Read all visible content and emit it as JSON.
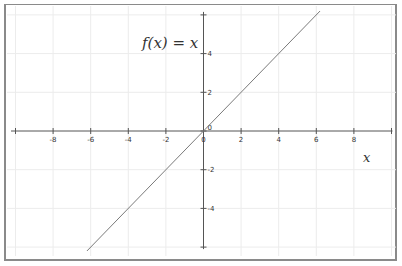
{
  "chart_data": {
    "type": "line",
    "title": "f(x) = x",
    "xlabel": "x",
    "ylabel": "",
    "function": "f(x) = x",
    "series": [
      {
        "name": "f(x) = x",
        "x": [
          -6.2,
          6.2
        ],
        "y": [
          -6.2,
          6.2
        ],
        "color": "#7a7a7a"
      }
    ],
    "xlim": [
      -10.5,
      10.5
    ],
    "ylim": [
      -6.2,
      6.2
    ],
    "x_ticks": [
      -10,
      -8,
      -6,
      -4,
      -2,
      0,
      2,
      4,
      6,
      8,
      10
    ],
    "x_tick_labels": [
      "",
      "-8",
      "-6",
      "-4",
      "-2",
      "0",
      "2",
      "4",
      "6",
      "8",
      ""
    ],
    "y_ticks": [
      -6,
      -4,
      -2,
      0,
      2,
      4,
      6
    ],
    "y_tick_labels": [
      "",
      "-4",
      "-2",
      "0",
      "2",
      "4",
      ""
    ],
    "grid": true,
    "legend": null
  },
  "colors": {
    "grid": "#ececec",
    "axis": "#555555",
    "line": "#7a7a7a",
    "frame": "#8a8a8a"
  },
  "labels": {
    "title": "f(x) = x",
    "x_axis": "x"
  }
}
